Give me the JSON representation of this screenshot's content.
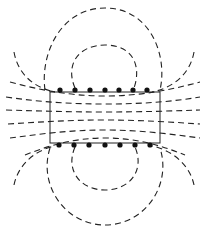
{
  "diagram": {
    "title": "",
    "colors": {
      "line": "#222222",
      "background": "#ffffff"
    },
    "solenoid": {
      "x": 50,
      "y": 92,
      "width": 110,
      "height": 51
    },
    "top_conductors_x": [
      60,
      75,
      90,
      105,
      119,
      133,
      147
    ],
    "bottom_conductors_x": [
      59,
      74,
      89,
      105,
      120,
      135,
      150
    ],
    "labels": []
  }
}
